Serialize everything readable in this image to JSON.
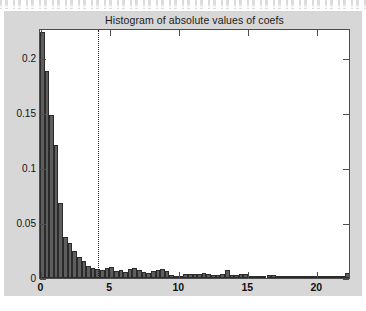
{
  "figure": {
    "background_color": "#d7d7d7",
    "axes_background_color": "#ffffff",
    "bar_fill_color": "#5e5e5e",
    "bar_edge_color": "#2b2b2b",
    "axis_color": "#4d4d4d"
  },
  "chart_data": {
    "type": "bar",
    "title": "Histogram of absolute values of coefs",
    "xlabel": "",
    "ylabel": "",
    "xlim": [
      0,
      22.35
    ],
    "ylim": [
      0,
      0.2255
    ],
    "grid": false,
    "legend": null,
    "xticks": [
      0,
      5,
      10,
      15,
      20
    ],
    "xticklabels": [
      "0",
      "5",
      "10",
      "15",
      "20"
    ],
    "yticks": [
      0,
      0.05,
      0.1,
      0.15,
      0.2
    ],
    "yticklabels": [
      "0",
      "0.05",
      "0.1",
      "0.15",
      "0.2"
    ],
    "bin_width": 0.335,
    "bin_starts": [
      0.0,
      0.335,
      0.67,
      1.005,
      1.34,
      1.675,
      2.01,
      2.345,
      2.68,
      3.015,
      3.35,
      3.685,
      4.02,
      4.355,
      4.69,
      5.025,
      5.36,
      5.695,
      6.03,
      6.365,
      6.7,
      7.035,
      7.37,
      7.705,
      8.04,
      8.375,
      8.71,
      9.045,
      9.38,
      9.715,
      10.05,
      10.385,
      10.72,
      11.055,
      11.39,
      11.725,
      12.06,
      12.395,
      12.73,
      13.065,
      13.4,
      13.735,
      14.07,
      14.405,
      14.74,
      15.075,
      15.41,
      15.745,
      16.08,
      16.415,
      16.75,
      17.085,
      17.42,
      17.755,
      18.09,
      18.425,
      18.76,
      19.095,
      19.43,
      19.765,
      20.1,
      20.435,
      20.77,
      21.105,
      21.44,
      21.775,
      22.11
    ],
    "values": [
      0.2245,
      0.1885,
      0.1485,
      0.1215,
      0.068,
      0.0375,
      0.032,
      0.0245,
      0.019,
      0.0155,
      0.011,
      0.009,
      0.0085,
      0.007,
      0.0095,
      0.01,
      0.006,
      0.007,
      0.0055,
      0.008,
      0.009,
      0.007,
      0.0055,
      0.0045,
      0.006,
      0.0075,
      0.008,
      0.006,
      0.0025,
      0.0015,
      0.001,
      0.0035,
      0.004,
      0.004,
      0.0035,
      0.0045,
      0.004,
      0.003,
      0.003,
      0.0035,
      0.0075,
      0.003,
      0.0025,
      0.004,
      0.0035,
      0.001,
      0.001,
      0.0008,
      0.0012,
      0.0025,
      0.0025,
      0.001,
      0.0005,
      0.0005,
      0.001,
      0.0015,
      0.001,
      0.0005,
      0.0004,
      0.0004,
      0.0005,
      0.0004,
      0.0003,
      0.0003,
      0.0004,
      0.0005,
      0.0045
    ],
    "annotations": [
      {
        "name": "threshold-line",
        "type": "vertical-dashed-line",
        "x": 4.2,
        "style": "dotted",
        "color": "#1f1f1f"
      }
    ]
  }
}
